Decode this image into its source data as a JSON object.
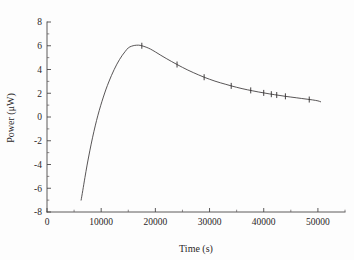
{
  "figure": {
    "background_color": "#fdfdfd",
    "line_color": "#3a3637",
    "axis_color": "#4a4748",
    "text_color": "#2a2627"
  },
  "chart_data": {
    "type": "line",
    "title": "",
    "subtitle": "",
    "xlabel": "Time (s)",
    "ylabel": "Power (μW)",
    "xlim": [
      0,
      55000
    ],
    "ylim": [
      -8,
      8
    ],
    "grid": false,
    "legend": null,
    "legend_position": "none",
    "x_major_ticks": [
      0,
      10000,
      20000,
      30000,
      40000,
      50000
    ],
    "x_tick_labels": [
      "0",
      "10000",
      "20000",
      "30000",
      "40000",
      "50000"
    ],
    "x_minor_ticks": [
      5000,
      15000,
      25000,
      35000,
      45000,
      55000
    ],
    "y_major_ticks": [
      -8,
      -6,
      -4,
      -2,
      0,
      2,
      4,
      6,
      8
    ],
    "y_tick_labels": [
      "-8",
      "-6",
      "-4",
      "-2",
      "0",
      "2",
      "4",
      "6",
      "8"
    ],
    "y_minor_ticks": [
      -7,
      -5,
      -3,
      -1,
      1,
      3,
      5,
      7
    ],
    "tick_direction": "in",
    "spines": [
      "left",
      "bottom"
    ],
    "series": [
      {
        "name": "power-curve",
        "style": "solid-line",
        "x": [
          6300,
          6600,
          7000,
          7400,
          7900,
          8400,
          8900,
          9400,
          9900,
          10400,
          10900,
          11400,
          11900,
          12400,
          12900,
          13400,
          13900,
          14400,
          15000,
          15600,
          16200,
          16900,
          17500,
          18300,
          19100,
          20000,
          21000,
          22000,
          23000,
          24000,
          25000,
          26000,
          27000,
          28000,
          29000,
          30000,
          31000,
          32000,
          33000,
          34000,
          35000,
          36000,
          37000,
          38000,
          39000,
          40000,
          41000,
          42000,
          43000,
          44000,
          45000,
          46000,
          47000,
          48000,
          49000,
          50000,
          50500
        ],
        "y": [
          -7.0,
          -6.2,
          -5.1,
          -4.05,
          -2.85,
          -1.75,
          -0.75,
          0.15,
          0.95,
          1.68,
          2.35,
          2.95,
          3.5,
          4.0,
          4.45,
          4.85,
          5.2,
          5.5,
          5.82,
          5.96,
          6.03,
          6.05,
          6.0,
          5.88,
          5.72,
          5.48,
          5.2,
          4.93,
          4.67,
          4.42,
          4.18,
          3.95,
          3.74,
          3.54,
          3.35,
          3.18,
          3.02,
          2.88,
          2.75,
          2.62,
          2.5,
          2.39,
          2.29,
          2.2,
          2.11,
          2.03,
          1.95,
          1.88,
          1.81,
          1.74,
          1.68,
          1.62,
          1.56,
          1.5,
          1.44,
          1.36,
          1.28
        ]
      }
    ],
    "data_markers": {
      "name": "error-bar-ticks",
      "description": "short vertical tick marks on the curve",
      "points": [
        {
          "x": 17500,
          "y": 6.0
        },
        {
          "x": 24000,
          "y": 4.42
        },
        {
          "x": 29000,
          "y": 3.35
        },
        {
          "x": 34000,
          "y": 2.62
        },
        {
          "x": 37600,
          "y": 2.24
        },
        {
          "x": 40000,
          "y": 2.03
        },
        {
          "x": 41400,
          "y": 1.92
        },
        {
          "x": 42400,
          "y": 1.85
        },
        {
          "x": 44000,
          "y": 1.74
        },
        {
          "x": 48400,
          "y": 1.47
        }
      ]
    }
  }
}
